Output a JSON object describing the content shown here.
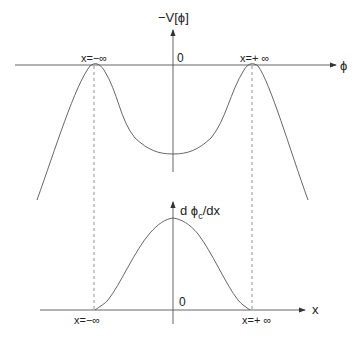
{
  "diagram": {
    "top_panel": {
      "y_axis_label": "−V[ϕ]",
      "x_axis_label": "ϕ",
      "origin_label": "0",
      "left_peak_label": "x=−∞",
      "right_peak_label": "x=+ ∞"
    },
    "bottom_panel": {
      "y_axis_label_main": "d ϕ",
      "y_axis_label_sub": "c",
      "y_axis_label_tail": "/dx",
      "x_axis_label": "x",
      "origin_label": "0",
      "left_end_label": "x=−∞",
      "right_end_label": "x=+ ∞"
    },
    "colors": {
      "line": "#555555",
      "text": "#222222"
    }
  }
}
